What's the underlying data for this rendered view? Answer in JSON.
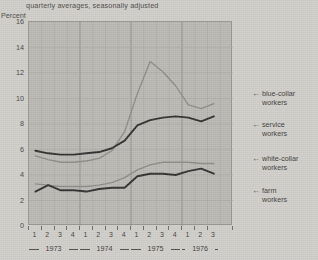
{
  "chart_title": "quarterly averages, seasonally adjusted",
  "y_axis_title": "Percent",
  "y_ticks": [
    "0",
    "2",
    "4",
    "6",
    "8",
    "10",
    "12",
    "14",
    "16"
  ],
  "quarter_labels": [
    "1",
    "2",
    "3",
    "4",
    "1",
    "2",
    "3",
    "4",
    "1",
    "2",
    "3",
    "4",
    "1",
    "2",
    "3"
  ],
  "years": [
    "1973",
    "1974",
    "1975",
    "1976"
  ],
  "legend": {
    "blue_collar": {
      "line1": "blue-collar",
      "line2": "workers",
      "arrow": "←"
    },
    "service": {
      "line1": "service",
      "line2": "workers",
      "arrow": "←"
    },
    "white_collar": {
      "line1": "white-collar",
      "line2": "workers",
      "arrow": "←"
    },
    "farm": {
      "line1": "farm",
      "line2": "workers",
      "arrow": "←"
    }
  },
  "colors": {
    "plot_background": "#b9b7b2",
    "page_background": "#cfcdc8",
    "grid_minor": "#a9a7a1",
    "grid_major": "#8e8c86",
    "dark_series": "#2f2f2d",
    "light_series": "#8c8a85"
  },
  "chart_data": {
    "type": "line",
    "title": "quarterly averages, seasonally adjusted",
    "xlabel": "",
    "ylabel": "Percent",
    "ylim": [
      0,
      16
    ],
    "grid": true,
    "legend_position": "right",
    "x": [
      "1973 Q1",
      "1973 Q2",
      "1973 Q3",
      "1973 Q4",
      "1974 Q1",
      "1974 Q2",
      "1974 Q3",
      "1974 Q4",
      "1975 Q1",
      "1975 Q2",
      "1975 Q3",
      "1975 Q4",
      "1976 Q1",
      "1976 Q2",
      "1976 Q3"
    ],
    "series": [
      {
        "name": "blue-collar workers",
        "style": "light-gray",
        "color": "#8c8a85",
        "values": [
          5.5,
          5.2,
          5.0,
          5.0,
          5.1,
          5.3,
          5.9,
          7.4,
          10.4,
          12.9,
          12.1,
          11.0,
          9.5,
          9.2,
          9.6
        ]
      },
      {
        "name": "service workers",
        "style": "dark",
        "color": "#2f2f2d",
        "values": [
          5.9,
          5.7,
          5.6,
          5.6,
          5.7,
          5.8,
          6.1,
          6.7,
          7.9,
          8.3,
          8.5,
          8.6,
          8.5,
          8.2,
          8.6
        ]
      },
      {
        "name": "white-collar workers",
        "style": "light-gray",
        "color": "#8c8a85",
        "values": [
          3.3,
          3.2,
          3.1,
          3.1,
          3.1,
          3.2,
          3.4,
          3.8,
          4.4,
          4.8,
          5.0,
          5.0,
          5.0,
          4.9,
          4.9
        ]
      },
      {
        "name": "farm workers",
        "style": "dark",
        "color": "#2f2f2d",
        "values": [
          2.7,
          3.2,
          2.8,
          2.8,
          2.7,
          2.9,
          3.0,
          3.0,
          3.9,
          4.1,
          4.1,
          4.0,
          4.3,
          4.5,
          4.1
        ]
      }
    ]
  }
}
